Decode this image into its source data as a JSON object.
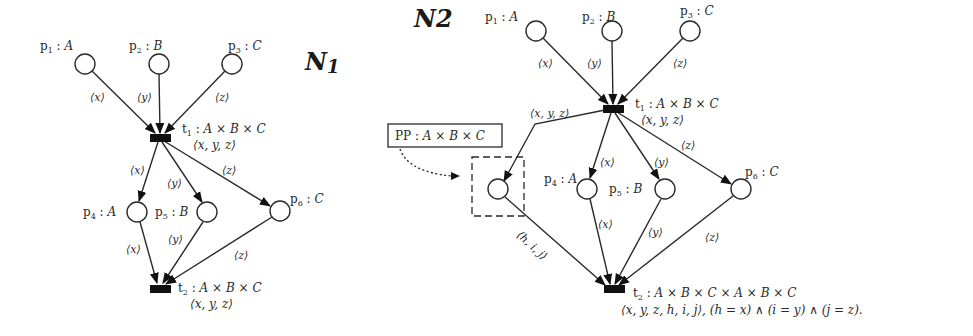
{
  "nets": [
    {
      "name": "N1",
      "places": [
        {
          "id": "p1",
          "name": "p",
          "sub": "1",
          "type": "A",
          "cx": 85,
          "cy": 64
        },
        {
          "id": "p2",
          "name": "p",
          "sub": "2",
          "type": "B",
          "cx": 159,
          "cy": 64
        },
        {
          "id": "p3",
          "name": "p",
          "sub": "3",
          "type": "C",
          "cx": 232,
          "cy": 64
        },
        {
          "id": "p4",
          "name": "p",
          "sub": "4",
          "type": "A",
          "cx": 137,
          "cy": 212
        },
        {
          "id": "p5",
          "name": "p",
          "sub": "5",
          "type": "B",
          "cx": 207,
          "cy": 212
        },
        {
          "id": "p6",
          "name": "p",
          "sub": "6",
          "type": "C",
          "cx": 280,
          "cy": 211
        }
      ],
      "transitions": [
        {
          "id": "t1",
          "name": "t",
          "sub": "1",
          "type": "A × B × C",
          "binding": "⟨x, y, z⟩",
          "cx": 160,
          "cy": 138
        },
        {
          "id": "t2",
          "name": "t",
          "sub": "2",
          "type": "A × B × C",
          "binding": "⟨x, y, z⟩",
          "cx": 160,
          "cy": 288
        }
      ],
      "arcs": [
        {
          "from": "p1",
          "to": "t1",
          "label": "⟨x⟩"
        },
        {
          "from": "p2",
          "to": "t1",
          "label": "⟨y⟩"
        },
        {
          "from": "p3",
          "to": "t1",
          "label": "⟨z⟩"
        },
        {
          "from": "t1",
          "to": "p4",
          "label": "⟨x⟩"
        },
        {
          "from": "t1",
          "to": "p5",
          "label": "⟨y⟩"
        },
        {
          "from": "t1",
          "to": "p6",
          "label": "⟨z⟩"
        },
        {
          "from": "p4",
          "to": "t2",
          "label": "⟨x⟩"
        },
        {
          "from": "p5",
          "to": "t2",
          "label": "⟨y⟩"
        },
        {
          "from": "p6",
          "to": "t2",
          "label": "⟨z⟩"
        }
      ]
    },
    {
      "name": "N2",
      "places": [
        {
          "id": "p1",
          "name": "p",
          "sub": "1",
          "type": "A",
          "cx": 536,
          "cy": 31
        },
        {
          "id": "p2",
          "name": "p",
          "sub": "2",
          "type": "B",
          "cx": 612,
          "cy": 31
        },
        {
          "id": "p3",
          "name": "p",
          "sub": "3",
          "type": "C",
          "cx": 690,
          "cy": 31
        },
        {
          "id": "PP",
          "name": "PP",
          "sub": "",
          "type": "A × B × C",
          "cx": 498,
          "cy": 189
        },
        {
          "id": "p4",
          "name": "p",
          "sub": "4",
          "type": "A",
          "cx": 587,
          "cy": 189
        },
        {
          "id": "p5",
          "name": "p",
          "sub": "5",
          "type": "B",
          "cx": 665,
          "cy": 189
        },
        {
          "id": "p6",
          "name": "p",
          "sub": "6",
          "type": "C",
          "cx": 741,
          "cy": 189
        }
      ],
      "transitions": [
        {
          "id": "t1",
          "name": "t",
          "sub": "1",
          "type": "A × B × C",
          "binding": "⟨x, y, z⟩",
          "cx": 613,
          "cy": 109
        },
        {
          "id": "t2",
          "name": "t",
          "sub": "2",
          "type": "A × B × C × A × B × C",
          "binding": "⟨x, y, z, h, i, j⟩,  (h = x) ∧ (i = y) ∧ (j = z).",
          "cx": 614,
          "cy": 289
        }
      ],
      "arcs": [
        {
          "from": "p1",
          "to": "t1",
          "label": "⟨x⟩"
        },
        {
          "from": "p2",
          "to": "t1",
          "label": "⟨y⟩"
        },
        {
          "from": "p3",
          "to": "t1",
          "label": "⟨z⟩"
        },
        {
          "from": "t1",
          "to": "PP",
          "label": "⟨x, y, z⟩"
        },
        {
          "from": "t1",
          "to": "p4",
          "label": "⟨x⟩"
        },
        {
          "from": "t1",
          "to": "p5",
          "label": "⟨y⟩"
        },
        {
          "from": "t1",
          "to": "p6",
          "label": "⟨z⟩"
        },
        {
          "from": "PP",
          "to": "t2",
          "label": "⟨h, i, j⟩"
        },
        {
          "from": "p4",
          "to": "t2",
          "label": "⟨x⟩"
        },
        {
          "from": "p5",
          "to": "t2",
          "label": "⟨y⟩"
        },
        {
          "from": "p6",
          "to": "t2",
          "label": "⟨z⟩"
        }
      ],
      "callout": {
        "label": "PP",
        "type": "A × B × C"
      }
    }
  ]
}
